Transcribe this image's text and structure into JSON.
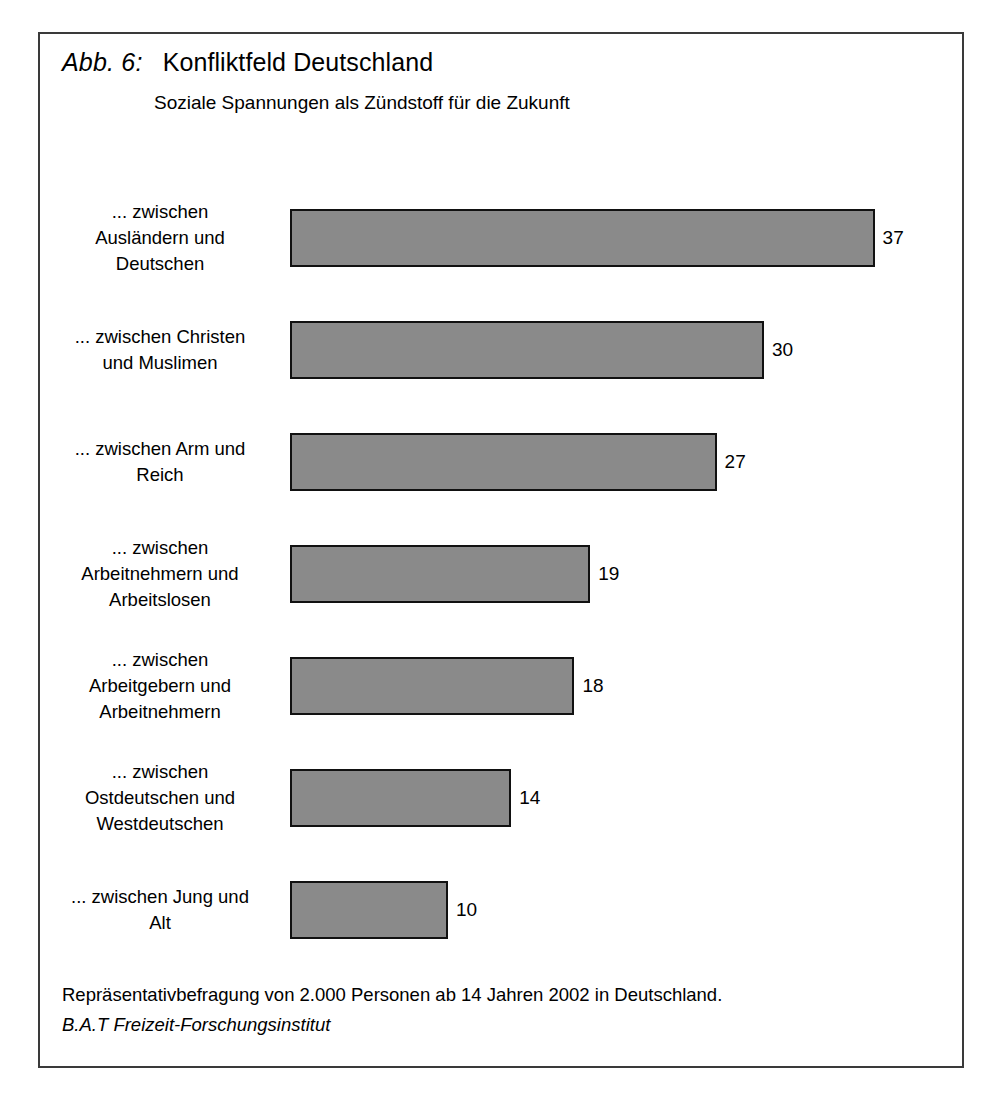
{
  "figure": {
    "number_label": "Abb. 6:",
    "title": "Konfliktfeld Deutschland",
    "subtitle": "Soziale Spannungen als Zündstoff für die Zukunft",
    "footnote": "Repräsentativbefragung von 2.000 Personen ab 14 Jahren 2002 in Deutschland.",
    "source": "B.A.T Freizeit-Forschungsinstitut",
    "border_color": "#3a3a3a",
    "bar_fill_color": "#8a8a8a",
    "bar_border_color": "#111111"
  },
  "chart_data": {
    "type": "bar",
    "orientation": "horizontal",
    "title": "Konfliktfeld Deutschland",
    "subtitle": "Soziale Spannungen als Zündstoff für die Zukunft",
    "xlabel": "",
    "ylabel": "",
    "xlim": [
      0,
      37
    ],
    "grid": false,
    "legend": "none",
    "value_labels": true,
    "categories": [
      "... zwischen\nAusländern und\nDeutschen",
      "... zwischen Christen\nund Muslimen",
      "... zwischen Arm und\nReich",
      "... zwischen\nArbeitnehmern und\nArbeitslosen",
      "... zwischen\nArbeitgebern und\nArbeitnehmern",
      "... zwischen\nOstdeutschen und\nWestdeutschen",
      "... zwischen Jung und\nAlt"
    ],
    "values": [
      37,
      30,
      27,
      19,
      18,
      14,
      10
    ],
    "value_label_texts": [
      "37",
      "30",
      "27",
      "19",
      "18",
      "14",
      "10"
    ],
    "annotation": "Repräsentativbefragung von 2.000 Personen ab 14 Jahren 2002 in Deutschland."
  }
}
